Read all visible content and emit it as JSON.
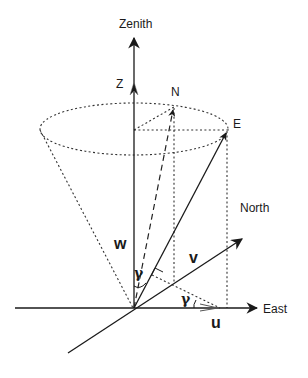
{
  "figure": {
    "type": "3D vector decomposition diagram",
    "labels": {
      "zenith": "Zenith",
      "z_axis": "Z",
      "north_point": "N",
      "east_point": "E",
      "north_axis": "North",
      "east_axis": "East",
      "w_component": "w",
      "v_component": "v",
      "u_component": "u",
      "angle_gamma_1": "γ",
      "angle_gamma_2": "γ"
    },
    "colors": {
      "line": "#1a1a1a",
      "background": "#ffffff"
    }
  }
}
